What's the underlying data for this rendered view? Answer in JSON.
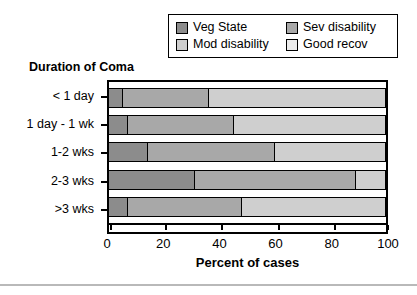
{
  "chart_data": {
    "type": "bar",
    "subtype": "horizontal-100-percent-stacked",
    "title": "",
    "xlabel": "Percent of cases",
    "ylabel": "Duration of Coma",
    "categories": [
      "< 1 day",
      "1 day - 1 wk",
      "1-2 wks",
      "2-3 wks",
      ">3 wks"
    ],
    "series": [
      {
        "name": "Veg State",
        "color": "#8c8c8c",
        "values": [
          5,
          7,
          14,
          31,
          7
        ]
      },
      {
        "name": "Sev disability",
        "color": "#a8a8a8",
        "values": [
          31,
          38,
          46,
          58,
          41
        ]
      },
      {
        "name": "Mod disability",
        "color": "#cfcfcf",
        "values": [
          64,
          55,
          40,
          11,
          52
        ]
      },
      {
        "name": "Good recov",
        "color": "#ececec",
        "values": [
          0,
          0,
          0,
          0,
          0
        ]
      }
    ],
    "xlim": [
      0,
      100
    ],
    "xticks": [
      0,
      20,
      40,
      60,
      80,
      100
    ],
    "xtick_labels": [
      "0",
      "20",
      "40",
      "60",
      "80",
      "100"
    ],
    "grid": false,
    "legend_position": "top-right",
    "legend_entries": [
      "Veg State",
      "Sev disability",
      "Mod disability",
      "Good recov"
    ]
  },
  "legend": {
    "items": [
      {
        "label": "Veg State",
        "color": "#8c8c8c"
      },
      {
        "label": "Sev disability",
        "color": "#a8a8a8"
      },
      {
        "label": "Mod disability",
        "color": "#cfcfcf"
      },
      {
        "label": "Good recov",
        "color": "#ececec"
      }
    ]
  },
  "axes": {
    "y_title": "Duration of Coma",
    "x_title": "Percent of cases",
    "y_categories": [
      "< 1 day",
      "1 day - 1 wk",
      "1-2 wks",
      "2-3 wks",
      ">3 wks"
    ],
    "x_tick_labels": [
      "0",
      "20",
      "40",
      "60",
      "80",
      "100"
    ]
  },
  "colors": {
    "veg_state": "#8c8c8c",
    "sev_disability": "#a8a8a8",
    "mod_disability": "#cfcfcf",
    "good_recov": "#ececec",
    "outline": "#000000",
    "background": "#ffffff",
    "rule": "#b9b9b9"
  }
}
